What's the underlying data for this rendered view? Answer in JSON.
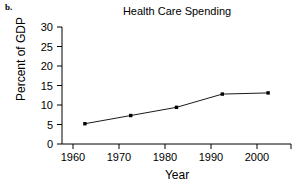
{
  "panel": {
    "label": "b."
  },
  "chart_data": {
    "type": "line",
    "title": "Health Care Spending",
    "xlabel": "Year",
    "ylabel": "Percent of GDP",
    "x": [
      1960,
      1970,
      1980,
      1990,
      2000
    ],
    "values": [
      5.2,
      7.3,
      9.4,
      12.8,
      13.1
    ],
    "xticklabels": [
      "1960",
      "1970",
      "1980",
      "1990",
      "2000"
    ],
    "yticklabels": [
      "0",
      "5",
      "10",
      "15",
      "20",
      "25",
      "30"
    ],
    "yticks": [
      0,
      5,
      10,
      15,
      20,
      25,
      30
    ],
    "xlim": [
      1955,
      2005
    ],
    "ylim": [
      0,
      30
    ],
    "grid": false,
    "legend": false,
    "marker": "square",
    "line_color": "#000000",
    "marker_color": "#000000",
    "background_color": "#ffffff"
  },
  "axis": {
    "x_ticks": [
      {
        "label": "1960"
      },
      {
        "label": "1970"
      },
      {
        "label": "1980"
      },
      {
        "label": "1990"
      },
      {
        "label": "2000"
      }
    ],
    "y_ticks": [
      {
        "label": "30"
      },
      {
        "label": "25"
      },
      {
        "label": "20"
      },
      {
        "label": "15"
      },
      {
        "label": "10"
      },
      {
        "label": "5"
      },
      {
        "label": "0"
      }
    ]
  }
}
